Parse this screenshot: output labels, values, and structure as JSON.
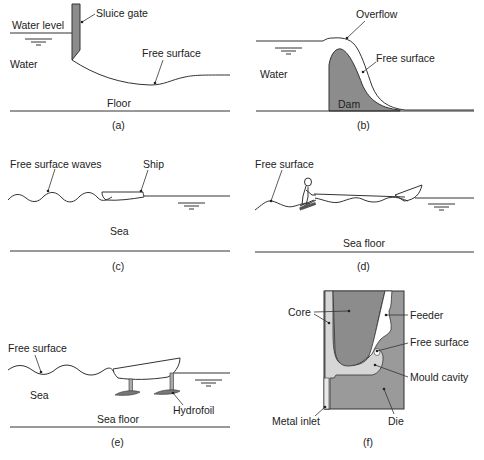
{
  "figure": {
    "panels": [
      {
        "id": "a",
        "caption": "(a)",
        "labels": {
          "sluice_gate": "Sluice gate",
          "water_level": "Water level",
          "water": "Water",
          "free_surface": "Free surface",
          "floor": "Floor"
        }
      },
      {
        "id": "b",
        "caption": "(b)",
        "labels": {
          "overflow": "Overflow",
          "free_surface": "Free surface",
          "water": "Water",
          "dam": "Dam"
        }
      },
      {
        "id": "c",
        "caption": "(c)",
        "labels": {
          "free_surface_waves": "Free surface waves",
          "ship": "Ship",
          "sea": "Sea"
        }
      },
      {
        "id": "d",
        "caption": "(d)",
        "labels": {
          "free_surface": "Free surface",
          "sea_floor": "Sea floor"
        }
      },
      {
        "id": "e",
        "caption": "(e)",
        "labels": {
          "free_surface": "Free surface",
          "sea": "Sea",
          "sea_floor": "Sea floor",
          "hydrofoil": "Hydrofoil"
        }
      },
      {
        "id": "f",
        "caption": "(f)",
        "labels": {
          "core": "Core",
          "feeder": "Feeder",
          "free_surface": "Free surface",
          "mould_cavity": "Mould cavity",
          "metal_inlet": "Metal inlet",
          "die": "Die"
        }
      }
    ],
    "colors": {
      "solid_gray": "#8c8c8c",
      "die_gray": "#9a9a9a",
      "cavity_light": "#d6d6d6",
      "line": "#333333"
    }
  }
}
